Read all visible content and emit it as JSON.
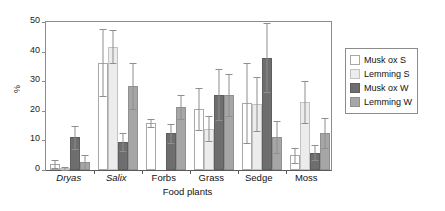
{
  "chart_data": {
    "type": "bar",
    "title": "",
    "xlabel": "Food plants",
    "ylabel": "%",
    "ylim": [
      0,
      50
    ],
    "yticks": [
      0,
      10,
      20,
      30,
      40,
      50
    ],
    "grid": false,
    "legend_position": "right",
    "categories": [
      "Dryas",
      "Salix",
      "Forbs",
      "Grass",
      "Sedge",
      "Moss"
    ],
    "category_styles": [
      "italic",
      "italic",
      "normal",
      "normal",
      "normal",
      "normal"
    ],
    "series": [
      {
        "name": "Musk ox S",
        "color": "#ffffff",
        "values": [
          2.0,
          36.2,
          15.8,
          20.6,
          22.5,
          5.0
        ],
        "errors": [
          1.4,
          11.3,
          1.3,
          7.0,
          13.5,
          2.6
        ]
      },
      {
        "name": "Lemming S",
        "color": "#ececec",
        "values": [
          0.5,
          41.7,
          0.0,
          13.9,
          22.3,
          23.1
        ],
        "errors": [
          0.4,
          5.6,
          0.0,
          4.2,
          9.0,
          7.1
        ]
      },
      {
        "name": "Musk ox W",
        "color": "#6e6e6e",
        "values": [
          11.0,
          9.4,
          12.4,
          25.5,
          38.0,
          5.8
        ],
        "errors": [
          4.0,
          3.0,
          3.3,
          8.5,
          11.8,
          2.5
        ]
      },
      {
        "name": "Lemming W",
        "color": "#a6a6a6",
        "values": [
          2.7,
          28.3,
          21.3,
          25.4,
          11.2,
          12.5
        ]
      }
    ],
    "series_errors_lemming_w": [
      2.2,
      7.8,
      4.0,
      7.0,
      5.5,
      5.0
    ]
  },
  "axes": {
    "y_tick_labels": [
      "50",
      "40",
      "30",
      "20",
      "10",
      "0"
    ],
    "y_axis_title": "%",
    "x_axis_title": "Food plants",
    "x_tick_labels": [
      "Dryas",
      "Salix",
      "Forbs",
      "Grass",
      "Sedge",
      "Moss"
    ]
  },
  "legend": {
    "items": [
      {
        "label": "Musk ox S",
        "swatch": "s-muskox",
        "color": "#ffffff"
      },
      {
        "label": "Lemming S",
        "swatch": "s-lemming",
        "color": "#ececec"
      },
      {
        "label": "Musk ox W",
        "swatch": "w-muskox",
        "color": "#6e6e6e"
      },
      {
        "label": "Lemming W",
        "swatch": "w-lemming",
        "color": "#a6a6a6"
      }
    ]
  },
  "colors": {
    "axis": "#5a5a5a",
    "frame": "#8c8c8c",
    "error_bar": "#8e8e8e",
    "text": "#111111",
    "background": "#ffffff"
  }
}
